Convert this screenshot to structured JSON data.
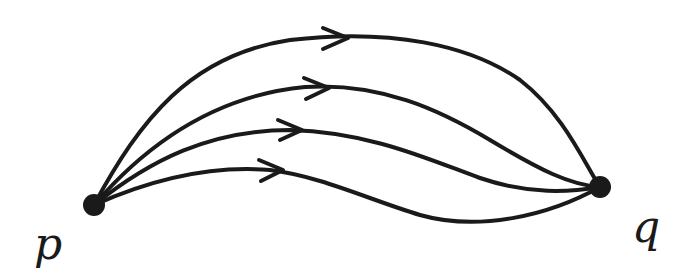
{
  "diagram": {
    "nodes": [
      {
        "id": "p",
        "label": "p",
        "x": 94,
        "y": 205
      },
      {
        "id": "q",
        "label": "q",
        "x": 600,
        "y": 187
      }
    ],
    "edges": [
      {
        "from": "p",
        "to": "q",
        "index": 1
      },
      {
        "from": "p",
        "to": "q",
        "index": 2
      },
      {
        "from": "p",
        "to": "q",
        "index": 3
      },
      {
        "from": "p",
        "to": "q",
        "index": 4
      }
    ],
    "color": "#1a1a1a"
  }
}
